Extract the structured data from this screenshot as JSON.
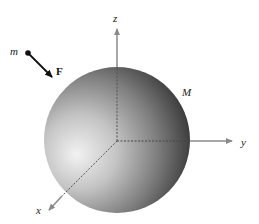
{
  "figure": {
    "sphere": {
      "label": "M",
      "center": [
        117,
        140
      ],
      "radius": 73,
      "highlight_color": "#f4f4f4",
      "mid_color": "#9a9a9a",
      "shadow_color": "#303030"
    },
    "axes": {
      "origin": [
        117,
        141
      ],
      "color": "#8a8a8a",
      "z": {
        "label": "z",
        "end": [
          117,
          27
        ]
      },
      "y": {
        "label": "y",
        "end": [
          234,
          141
        ]
      },
      "x": {
        "label": "x",
        "end": [
          47,
          212
        ]
      }
    },
    "particle": {
      "label": "m",
      "position": [
        28,
        53
      ]
    },
    "force": {
      "label": "F",
      "start": [
        28,
        53
      ],
      "end": [
        54,
        79
      ],
      "color": "#111111"
    }
  }
}
